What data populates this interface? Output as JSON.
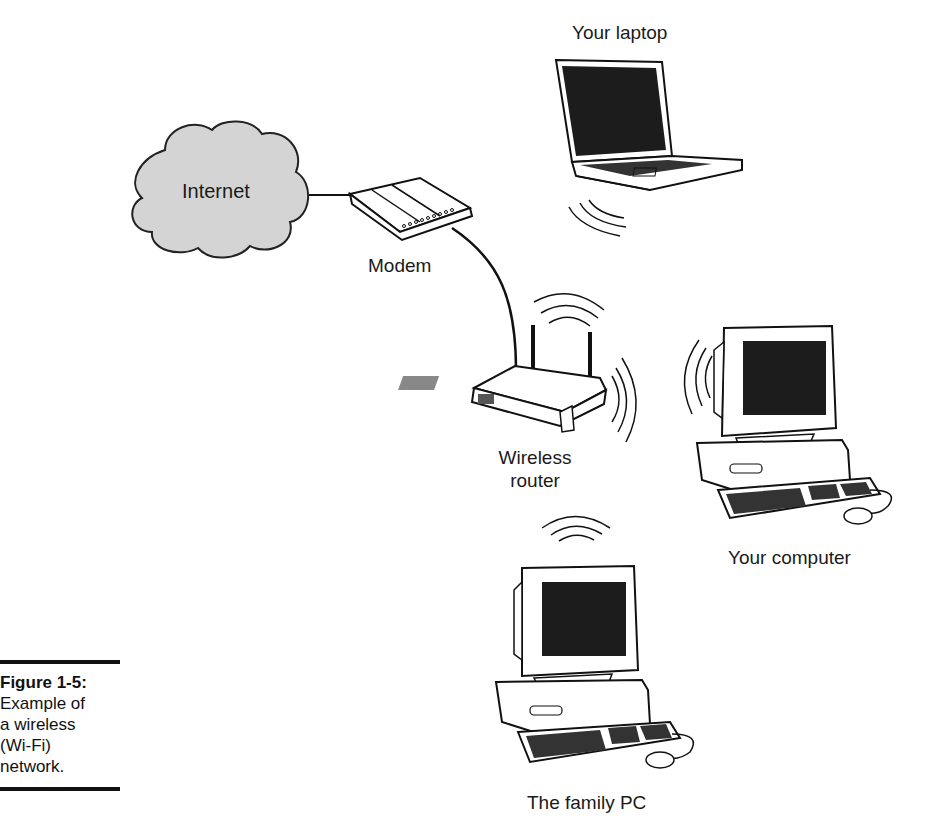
{
  "diagram": {
    "nodes": {
      "internet": {
        "label": "Internet"
      },
      "modem": {
        "label": "Modem"
      },
      "laptop": {
        "label": "Your laptop"
      },
      "router": {
        "label_line1": "Wireless",
        "label_line2": "router"
      },
      "computer": {
        "label": "Your computer"
      },
      "family_pc": {
        "label": "The family PC"
      }
    },
    "connections": [
      {
        "from": "internet",
        "to": "modem",
        "type": "wired"
      },
      {
        "from": "modem",
        "to": "router",
        "type": "wired"
      },
      {
        "from": "router",
        "to": "laptop",
        "type": "wireless"
      },
      {
        "from": "router",
        "to": "computer",
        "type": "wireless"
      },
      {
        "from": "router",
        "to": "family_pc",
        "type": "wireless"
      }
    ],
    "colors": {
      "cloud_fill": "#d4d4d4",
      "line": "#111111",
      "screen": "#1c1c1c"
    }
  },
  "caption": {
    "title": "Figure 1-5:",
    "line1": "Example of",
    "line2": "a wireless",
    "line3": "(Wi-Fi)",
    "line4": "network."
  }
}
